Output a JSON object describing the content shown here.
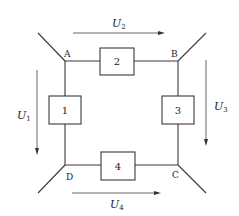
{
  "diagram": {
    "nodes": [
      {
        "id": "A",
        "label": "A"
      },
      {
        "id": "B",
        "label": "B"
      },
      {
        "id": "C",
        "label": "C"
      },
      {
        "id": "D",
        "label": "D"
      }
    ],
    "elements": [
      {
        "id": "1",
        "label": "1",
        "between": "A-D"
      },
      {
        "id": "2",
        "label": "2",
        "between": "A-B"
      },
      {
        "id": "3",
        "label": "3",
        "between": "B-C"
      },
      {
        "id": "4",
        "label": "4",
        "between": "D-C"
      }
    ],
    "voltages": [
      {
        "id": "U1",
        "symbol": "U",
        "subscript": "1",
        "direction": "down"
      },
      {
        "id": "U2",
        "symbol": "U",
        "subscript": "2",
        "direction": "right"
      },
      {
        "id": "U3",
        "symbol": "U",
        "subscript": "3",
        "direction": "down"
      },
      {
        "id": "U4",
        "symbol": "U",
        "subscript": "4",
        "direction": "right"
      }
    ]
  }
}
